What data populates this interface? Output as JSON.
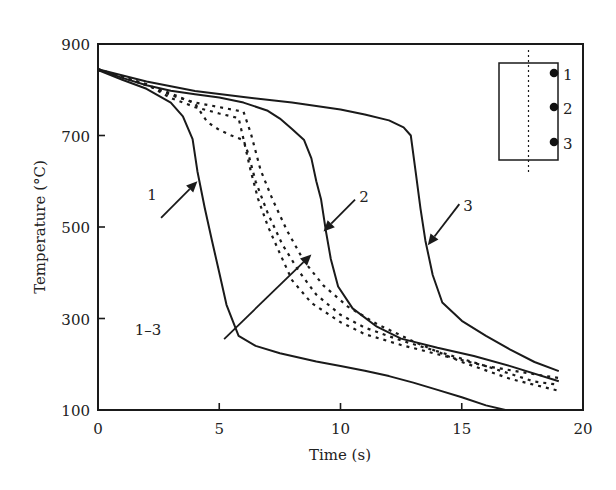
{
  "chart_data": {
    "type": "line",
    "title": "",
    "xlabel": "Time (s)",
    "ylabel": "Temperature (°C)",
    "xlim": [
      0,
      20
    ],
    "ylim": [
      100,
      900
    ],
    "xticks": [
      0,
      5,
      10,
      15,
      20
    ],
    "yticks": [
      100,
      300,
      500,
      700,
      900
    ],
    "xtick_labels": [
      "0",
      "5",
      "10",
      "15",
      "20"
    ],
    "ytick_labels": [
      "100",
      "300",
      "500",
      "700",
      "900"
    ],
    "grid": false,
    "series": [
      {
        "name": "1",
        "style": "solid",
        "x": [
          0,
          1,
          2,
          3,
          3.5,
          3.9,
          4.1,
          4.4,
          4.7,
          5,
          5.3,
          5.8,
          6.5,
          7.5,
          9,
          10,
          11,
          12,
          13,
          14,
          15,
          16,
          16.8
        ],
        "y": [
          843,
          822,
          802,
          772,
          742,
          692,
          622,
          542,
          470,
          400,
          330,
          262,
          240,
          224,
          206,
          196,
          186,
          174,
          160,
          144,
          128,
          110,
          100
        ]
      },
      {
        "name": "2",
        "style": "solid",
        "x": [
          0,
          1,
          2,
          3,
          4,
          5,
          6,
          7,
          7.5,
          8,
          8.5,
          8.8,
          9,
          9.2,
          9.4,
          9.6,
          9.9,
          10.5,
          11.5,
          12.5,
          14,
          15.5,
          17,
          19
        ],
        "y": [
          845,
          826,
          810,
          798,
          790,
          783,
          772,
          754,
          737,
          714,
          690,
          650,
          600,
          560,
          490,
          430,
          370,
          322,
          282,
          256,
          236,
          218,
          196,
          163
        ]
      },
      {
        "name": "3",
        "style": "solid",
        "x": [
          0,
          2,
          4,
          6,
          8,
          10,
          11,
          12,
          12.6,
          12.9,
          13.1,
          13.3,
          13.5,
          13.8,
          14.2,
          15,
          16,
          17,
          18,
          19
        ],
        "y": [
          845,
          818,
          797,
          784,
          772,
          757,
          746,
          733,
          718,
          700,
          620,
          540,
          470,
          395,
          335,
          295,
          262,
          232,
          205,
          185
        ]
      },
      {
        "name": "1-3 (a)",
        "style": "dashed",
        "x": [
          0,
          2,
          3,
          4,
          5,
          5.8,
          6,
          6.3,
          6.6,
          7,
          7.5,
          8,
          8.8,
          10,
          11,
          12.5,
          14,
          16,
          18,
          19
        ],
        "y": [
          845,
          812,
          782,
          762,
          748,
          738,
          692,
          622,
          562,
          502,
          442,
          384,
          334,
          292,
          266,
          242,
          222,
          196,
          178,
          170
        ]
      },
      {
        "name": "1-3 (b)",
        "style": "dashed",
        "x": [
          0,
          3,
          4,
          4.5,
          5,
          5.5,
          6,
          6.2,
          6.5,
          7,
          7.6,
          8.3,
          9,
          10,
          11,
          12.5,
          14,
          16,
          18,
          19
        ],
        "y": [
          845,
          792,
          770,
          730,
          712,
          700,
          690,
          660,
          600,
          530,
          462,
          402,
          352,
          308,
          280,
          252,
          228,
          196,
          162,
          155
        ]
      },
      {
        "name": "1-3 (c)",
        "style": "dashed",
        "x": [
          0,
          2,
          3,
          4,
          5,
          6,
          6.3,
          6.7,
          7.2,
          7.8,
          8.5,
          9.3,
          10.3,
          11.5,
          13,
          15,
          17,
          19
        ],
        "y": [
          843,
          812,
          788,
          772,
          762,
          752,
          705,
          625,
          560,
          492,
          425,
          372,
          326,
          288,
          250,
          205,
          168,
          142
        ]
      }
    ],
    "annotations": [
      {
        "text": "1",
        "points_to": "curve 1",
        "arrow_from": [
          2.6,
          520
        ],
        "arrow_to": [
          4.1,
          600
        ]
      },
      {
        "text": "2",
        "points_to": "curve 2",
        "arrow_from": [
          10.6,
          560
        ],
        "arrow_to": [
          9.3,
          490
        ]
      },
      {
        "text": "3",
        "points_to": "curve 3",
        "arrow_from": [
          14.9,
          550
        ],
        "arrow_to": [
          13.6,
          460
        ]
      },
      {
        "text": "1–3",
        "points_to": "dashed curves",
        "arrow_from": [
          5.2,
          255
        ],
        "arrow_to": [
          8.8,
          440
        ]
      }
    ],
    "inset": {
      "description": "sample cross-section with thermocouple positions",
      "labels": [
        "1",
        "2",
        "3"
      ]
    },
    "legend": "none"
  }
}
